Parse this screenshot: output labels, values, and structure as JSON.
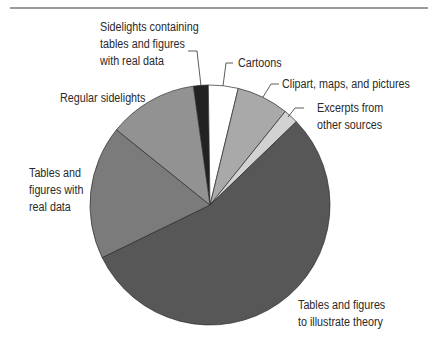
{
  "chart_data": {
    "type": "pie",
    "title": "",
    "start_angle_deg": -8,
    "direction": "clockwise",
    "slices": [
      {
        "label": "Sidelights containing tables and figures with real data",
        "value": 2,
        "color": "#222222"
      },
      {
        "label": "Cartoons",
        "value": 4,
        "color": "#ffffff"
      },
      {
        "label": "Clipart, maps, and pictures",
        "value": 7,
        "color": "#a9a9a9"
      },
      {
        "label": "Excerpts from other sources",
        "value": 2,
        "color": "#d2d2d2"
      },
      {
        "label": "Tables and figures to illustrate theory",
        "value": 55,
        "color": "#575757"
      },
      {
        "label": "Tables and figures with real data",
        "value": 18,
        "color": "#7b7b7b"
      },
      {
        "label": "Regular sidelights",
        "value": 12,
        "color": "#929292"
      }
    ],
    "legend": "none (direct labels with leader lines)"
  },
  "labels": {
    "sidelights_real": [
      "Sidelights containing",
      "tables and figures",
      "with real data"
    ],
    "cartoons": [
      "Cartoons"
    ],
    "clipart": [
      "Clipart, maps, and pictures"
    ],
    "excerpts": [
      "Excerpts from",
      "other sources"
    ],
    "regular": [
      "Regular sidelights"
    ],
    "real_data": [
      "Tables and",
      "figures with",
      "real data"
    ],
    "theory": [
      "Tables and figures",
      "to illustrate theory"
    ]
  }
}
